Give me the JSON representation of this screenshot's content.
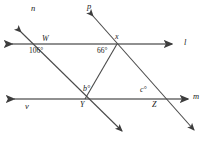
{
  "diagram": {
    "type": "geometry-transversal-diagram",
    "stroke_color": "#4a4a4a",
    "text_color": "#1a1a1a",
    "background": "#ffffff",
    "lines": [
      {
        "name": "l",
        "label": "l",
        "kind": "horizontal",
        "y": 44,
        "arrows": "both"
      },
      {
        "name": "m",
        "label": "m",
        "kind": "horizontal",
        "y": 99,
        "arrows": "both"
      },
      {
        "name": "n",
        "label": "n",
        "kind": "transversal",
        "arrows": "both"
      },
      {
        "name": "p",
        "label": "p",
        "kind": "transversal",
        "arrows": "both"
      },
      {
        "name": "v",
        "label": "v",
        "kind": "horizontal-left-end",
        "arrows": "left"
      }
    ],
    "line_labels": {
      "n": "n",
      "p": "p",
      "l": "l",
      "v": "v",
      "m": "m"
    },
    "points": [
      {
        "name": "W",
        "label": "W",
        "x": 45,
        "y": 44
      },
      {
        "name": "x",
        "label": "x",
        "x": 117,
        "y": 44
      },
      {
        "name": "Y",
        "label": "Y",
        "x": 85,
        "y": 99
      },
      {
        "name": "Z",
        "label": "Z",
        "x": 157,
        "y": 99
      }
    ],
    "point_labels": {
      "W": "W",
      "x": "x",
      "Y": "Y",
      "Z": "Z"
    },
    "angles": [
      {
        "name": "angle-at-W",
        "label": "106°",
        "vertex": "W",
        "position": "below-left",
        "value": 106,
        "unit": "degrees"
      },
      {
        "name": "angle-at-x",
        "label": "66°",
        "vertex": "x",
        "position": "below-left",
        "value": 66,
        "unit": "degrees"
      },
      {
        "name": "angle-at-Y",
        "label": "b°",
        "vertex": "Y",
        "position": "above",
        "value": "b",
        "unit": "degrees"
      },
      {
        "name": "angle-at-Z",
        "label": "c°",
        "vertex": "Z",
        "position": "above-left",
        "value": "c",
        "unit": "degrees"
      }
    ],
    "angle_labels": {
      "at_W": "106°",
      "at_x": "66°",
      "at_Y": "b°",
      "at_Z": "c°"
    }
  }
}
